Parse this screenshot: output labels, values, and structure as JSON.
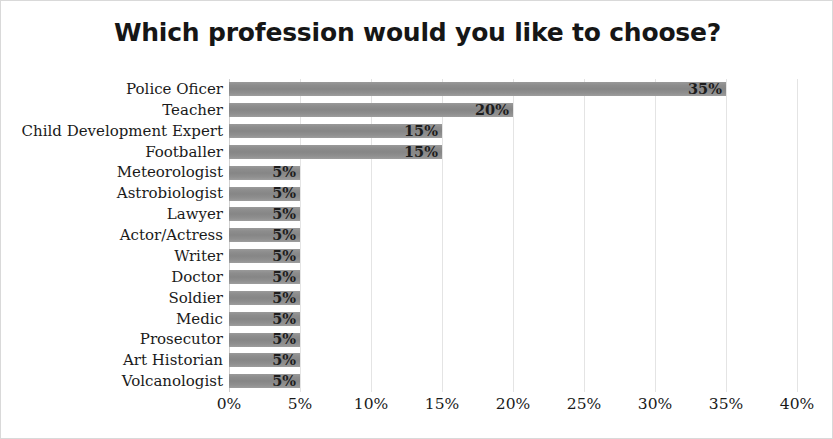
{
  "chart_data": {
    "type": "bar",
    "orientation": "horizontal",
    "title": "Which profession would you like to choose?",
    "xlabel": "",
    "ylabel": "",
    "xlim": [
      0,
      40
    ],
    "xtick_labels": [
      "0%",
      "5%",
      "10%",
      "15%",
      "20%",
      "25%",
      "30%",
      "35%",
      "40%"
    ],
    "xticks": [
      0,
      5,
      10,
      15,
      20,
      25,
      30,
      35,
      40
    ],
    "grid": true,
    "legend": false,
    "bar_color": "#8d8d8d",
    "categories": [
      "Police Oficer",
      "Teacher",
      "Child Development Expert",
      "Footballer",
      "Meteorologist",
      "Astrobiologist",
      "Lawyer",
      "Actor/Actress",
      "Writer",
      "Doctor",
      "Soldier",
      "Medic",
      "Prosecutor",
      "Art Historian",
      "Volcanologist"
    ],
    "values": [
      35,
      20,
      15,
      15,
      5,
      5,
      5,
      5,
      5,
      5,
      5,
      5,
      5,
      5,
      5
    ],
    "data_labels": [
      "35%",
      "20%",
      "15%",
      "15%",
      "5%",
      "5%",
      "5%",
      "5%",
      "5%",
      "5%",
      "5%",
      "5%",
      "5%",
      "5%",
      "5%"
    ]
  }
}
